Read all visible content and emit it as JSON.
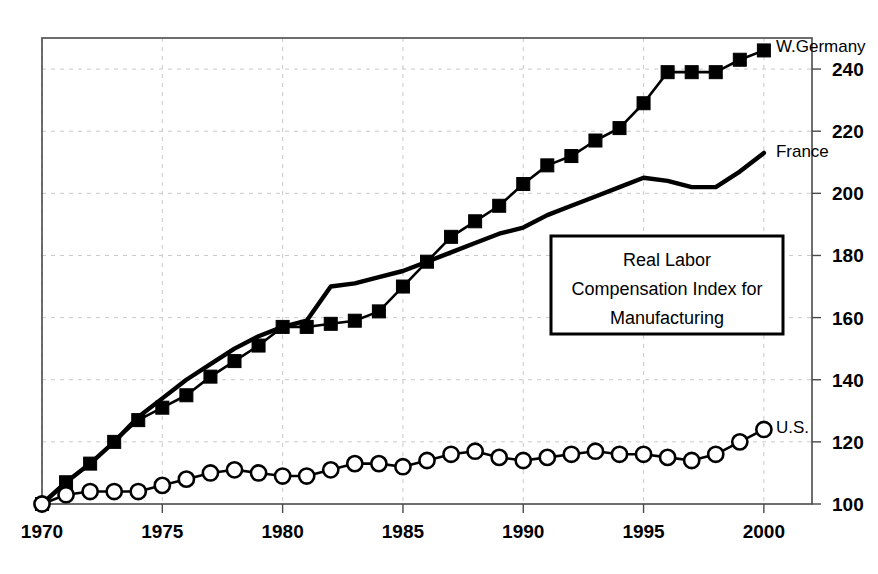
{
  "chart_data": {
    "type": "line",
    "title": "",
    "annotation_box": {
      "lines": [
        "Real Labor",
        "Compensation Index for",
        "Manufacturing"
      ]
    },
    "xlabel": "",
    "ylabel": "",
    "xlim": [
      1970,
      2002
    ],
    "ylim": [
      100,
      250
    ],
    "xticks": [
      1970,
      1975,
      1980,
      1985,
      1990,
      1995,
      2000
    ],
    "xtick_labels": [
      "1970",
      "1975",
      "1980",
      "1985",
      "1990",
      "1995",
      "2000"
    ],
    "yticks": [
      100,
      120,
      140,
      160,
      180,
      200,
      220,
      240
    ],
    "ytick_labels": [
      "100",
      "120",
      "140",
      "160",
      "180",
      "200",
      "220",
      "240"
    ],
    "y_axis_position": "right",
    "grid": "vertical dashed at xticks, horizontal dashed at yticks",
    "legend_position": "inline end-of-line labels",
    "x": [
      1970,
      1971,
      1972,
      1973,
      1974,
      1975,
      1976,
      1977,
      1978,
      1979,
      1980,
      1981,
      1982,
      1983,
      1984,
      1985,
      1986,
      1987,
      1988,
      1989,
      1990,
      1991,
      1992,
      1993,
      1994,
      1995,
      1996,
      1997,
      1998,
      1999,
      2000
    ],
    "series": [
      {
        "name": "W.Germany",
        "label": "W.Germany",
        "marker": "filled-square",
        "values": [
          100,
          107,
          113,
          120,
          127,
          131,
          135,
          141,
          146,
          151,
          157,
          157,
          158,
          159,
          162,
          170,
          178,
          186,
          191,
          196,
          203,
          209,
          212,
          217,
          221,
          229,
          239,
          239,
          239,
          243,
          246
        ]
      },
      {
        "name": "France",
        "label": "France",
        "marker": "none",
        "values": [
          100,
          107,
          113,
          120,
          128,
          134,
          140,
          145,
          150,
          154,
          157,
          159,
          170,
          171,
          173,
          175,
          178,
          181,
          184,
          187,
          189,
          193,
          196,
          199,
          202,
          205,
          204,
          202,
          202,
          207,
          213
        ]
      },
      {
        "name": "U.S.",
        "label": "U.S.",
        "marker": "open-circle",
        "values": [
          100,
          103,
          104,
          104,
          104,
          106,
          108,
          110,
          111,
          110,
          109,
          109,
          111,
          113,
          113,
          112,
          114,
          116,
          117,
          115,
          114,
          115,
          116,
          117,
          116,
          116,
          115,
          114,
          116,
          120,
          124
        ]
      }
    ]
  }
}
